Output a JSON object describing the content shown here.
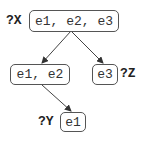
{
  "nodes": {
    "root": {
      "label": "?X",
      "content": "e1, e2, e3"
    },
    "left": {
      "content": "e1, e2"
    },
    "right": {
      "label": "?Z",
      "content": "e3"
    },
    "leaf": {
      "label": "?Y",
      "content": "e1"
    }
  },
  "edges": [
    {
      "from": "root",
      "to": "left"
    },
    {
      "from": "root",
      "to": "right"
    },
    {
      "from": "left",
      "to": "leaf"
    }
  ]
}
